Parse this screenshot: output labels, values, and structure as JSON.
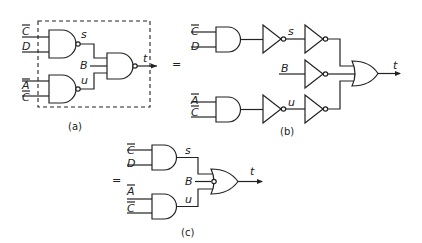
{
  "figure": {
    "panels": [
      {
        "id": "a",
        "caption": "(a)",
        "inputs": [
          "C̄",
          "D",
          "B",
          "Ā",
          "C̄"
        ],
        "signals": [
          "s",
          "u"
        ],
        "output": "t",
        "gates": [
          "NAND",
          "NAND",
          "NAND (3-input)"
        ],
        "boundary": "dashed box"
      },
      {
        "id": "b",
        "caption": "(b)",
        "inputs": [
          "C̄",
          "D",
          "B",
          "Ā",
          "C̄"
        ],
        "signals": [
          "s",
          "u"
        ],
        "output": "t",
        "gates": [
          "AND",
          "AND",
          "NOT",
          "NOT",
          "NOT",
          "NOT",
          "NOT",
          "OR (3-input)"
        ]
      },
      {
        "id": "c",
        "caption": "(c)",
        "inputs": [
          "C̄",
          "D",
          "B",
          "Ā",
          "C̄"
        ],
        "signals": [
          "s",
          "u"
        ],
        "output": "t",
        "gates": [
          "AND",
          "AND",
          "OR (3-input, inverted B input)"
        ]
      }
    ],
    "equals_sign": "="
  },
  "labels": {
    "a": {
      "in1": "C",
      "in2": "D",
      "in3": "B",
      "in4": "A",
      "in5": "C",
      "s": "s",
      "u": "u",
      "t": "t",
      "caption": "(a)"
    },
    "b": {
      "in1": "C",
      "in2": "D",
      "in3": "B",
      "in4": "A",
      "in5": "C",
      "s": "s",
      "u": "u",
      "t": "t",
      "caption": "(b)"
    },
    "c": {
      "in1": "C",
      "in2": "D",
      "in3": "B",
      "in4": "A",
      "in5": "C",
      "s": "s",
      "u": "u",
      "t": "t",
      "caption": "(c)"
    },
    "eq1": "=",
    "eq2": "="
  }
}
